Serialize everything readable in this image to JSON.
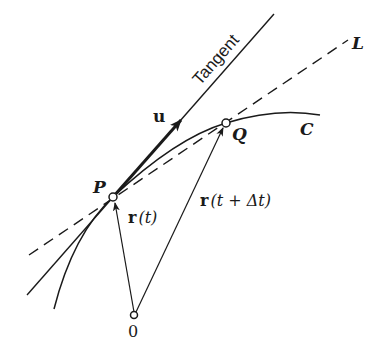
{
  "figure": {
    "colors": {
      "ink": "#1a1a1a",
      "background": "#ffffff"
    }
  },
  "labels": {
    "tangent": "Tangent",
    "unit_vector": "u",
    "secant_line": "L",
    "point_p": "P",
    "point_q": "Q",
    "curve": "C",
    "origin": "0",
    "position_p_vec": "r",
    "position_p_arg": "(t)",
    "position_q_vec": "r",
    "position_q_arg": "(t + Δt)"
  },
  "geometry": {
    "points": {
      "P": [
        113,
        197
      ],
      "Q": [
        226,
        123
      ],
      "O": [
        134,
        316
      ]
    },
    "tangent_line": {
      "from": [
        27,
        295
      ],
      "to": [
        274,
        14
      ],
      "style": "solid"
    },
    "secant_line_L": {
      "from": [
        29,
        255
      ],
      "to": [
        348,
        40
      ],
      "style": "dashed"
    },
    "curve_C": {
      "start": [
        54,
        309
      ],
      "through": [
        "P",
        "Q"
      ],
      "end": [
        320,
        115
      ]
    },
    "vectors": [
      {
        "name": "u",
        "from": "P",
        "to": [
          182,
          119
        ],
        "weight": "bold"
      },
      {
        "name": "r(t)",
        "from": "O",
        "to": "P"
      },
      {
        "name": "r(t + Δt)",
        "from": "O",
        "to": "Q"
      }
    ]
  }
}
